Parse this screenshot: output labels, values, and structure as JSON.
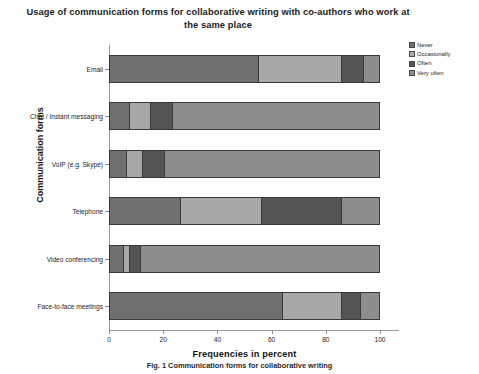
{
  "chart_data": {
    "type": "bar",
    "orientation": "horizontal",
    "stacked": true,
    "stacked_mode": "percent",
    "title": "Usage of communication forms for collaborative writing with co-authors who work at the same place",
    "xlabel": "Frequencies in percent",
    "ylabel": "Communication forms",
    "xlim": [
      0,
      100
    ],
    "xticks": [
      "0",
      "20",
      "40",
      "60",
      "80",
      "100"
    ],
    "grid": false,
    "legend_position": "right",
    "categories": [
      "Email",
      "Chat / Instant messaging",
      "VoIP (e.g. Skype)",
      "Telephone",
      "Video conferencing",
      "Face-to-face meetings"
    ],
    "series": [
      {
        "name": "Never",
        "color": "#6f6f6f",
        "values": [
          55,
          7,
          6,
          26,
          5,
          64
        ]
      },
      {
        "name": "Occasionally",
        "color": "#a8a8a8",
        "values": [
          31,
          8,
          6,
          30,
          2,
          22
        ]
      },
      {
        "name": "Often",
        "color": "#545454",
        "values": [
          8,
          8,
          8,
          30,
          4,
          7
        ]
      },
      {
        "name": "Very often",
        "color": "#8d8d8d",
        "values": [
          6,
          77,
          80,
          14,
          89,
          7
        ]
      }
    ]
  },
  "caption": "Fig. 1 Communication forms for collaborative writing",
  "legend": {
    "items": [
      {
        "label": "Never"
      },
      {
        "label": "Occasionally"
      },
      {
        "label": "Often"
      },
      {
        "label": "Very often"
      }
    ]
  }
}
